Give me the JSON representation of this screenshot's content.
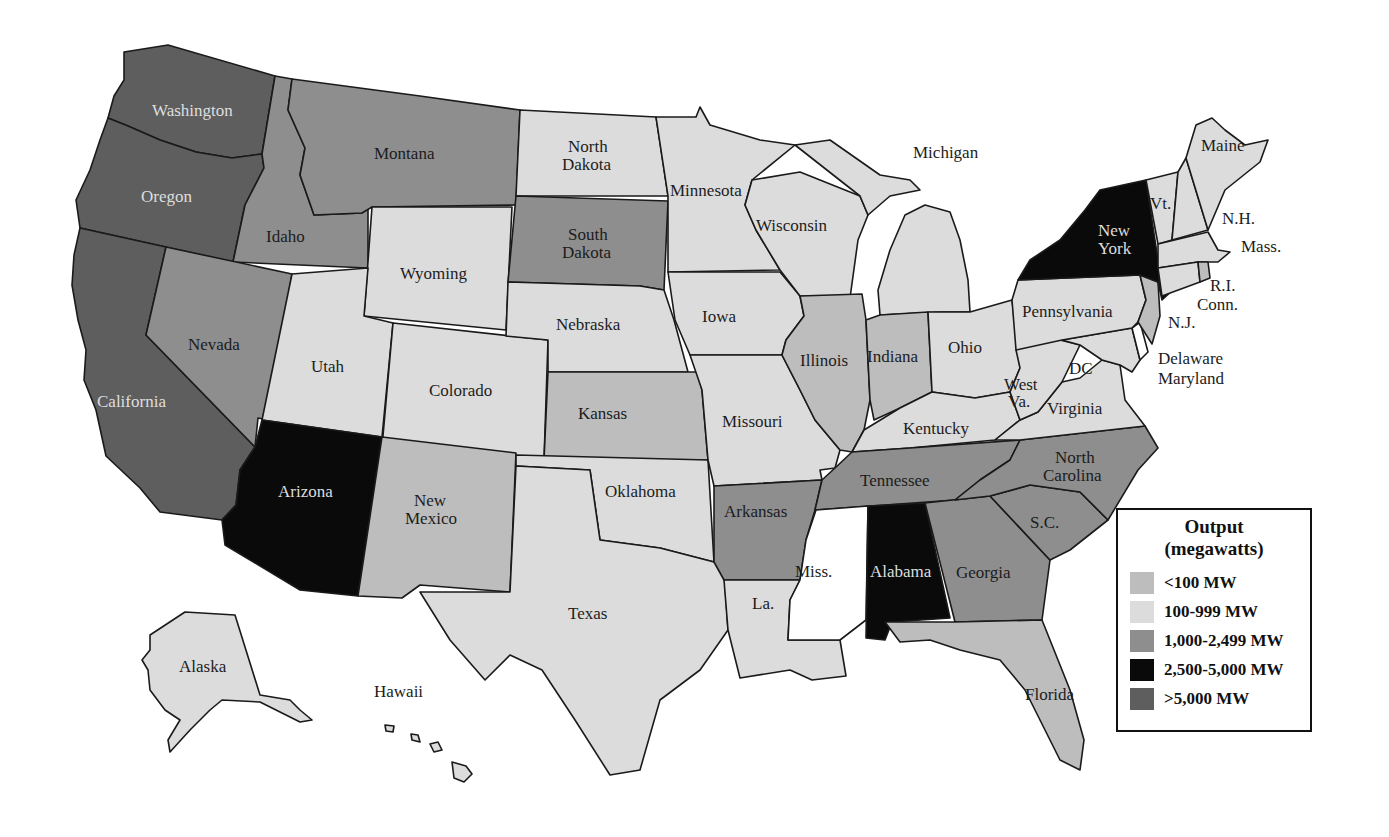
{
  "legend": {
    "title_line1": "Output",
    "title_line2": "(megawatts)",
    "items": [
      {
        "key": "lt100",
        "label": "<100 MW",
        "color": "#bdbdbd"
      },
      {
        "key": "c100_999",
        "label": "100-999 MW",
        "color": "#dcdcdc"
      },
      {
        "key": "c1000_2499",
        "label": "1,000-2,499 MW",
        "color": "#8e8e8e"
      },
      {
        "key": "c2500_5000",
        "label": "2,500-5,000 MW",
        "color": "#0a0a0a"
      },
      {
        "key": "gt5000",
        "label": ">5,000 MW",
        "color": "#5e5e5e"
      }
    ],
    "no_data_color": "#ffffff"
  },
  "states": {
    "washington": {
      "label": "Washington",
      "category": ">5,000 MW"
    },
    "oregon": {
      "label": "Oregon",
      "category": ">5,000 MW"
    },
    "california": {
      "label": "California",
      "category": ">5,000 MW"
    },
    "idaho": {
      "label": "Idaho",
      "category": "1,000-2,499 MW"
    },
    "montana": {
      "label": "Montana",
      "category": "1,000-2,499 MW"
    },
    "nevada": {
      "label": "Nevada",
      "category": "1,000-2,499 MW"
    },
    "wyoming": {
      "label": "Wyoming",
      "category": "100-999 MW"
    },
    "utah": {
      "label": "Utah",
      "category": "100-999 MW"
    },
    "colorado": {
      "label": "Colorado",
      "category": "100-999 MW"
    },
    "arizona": {
      "label": "Arizona",
      "category": "2,500-5,000 MW"
    },
    "new_mexico": {
      "label_line1": "New",
      "label_line2": "Mexico",
      "category": "<100 MW"
    },
    "north_dakota": {
      "label_line1": "North",
      "label_line2": "Dakota",
      "category": "100-999 MW"
    },
    "south_dakota": {
      "label_line1": "South",
      "label_line2": "Dakota",
      "category": "1,000-2,499 MW"
    },
    "nebraska": {
      "label": "Nebraska",
      "category": "100-999 MW"
    },
    "kansas": {
      "label": "Kansas",
      "category": "<100 MW"
    },
    "oklahoma": {
      "label": "Oklahoma",
      "category": "100-999 MW"
    },
    "texas": {
      "label": "Texas",
      "category": "100-999 MW"
    },
    "minnesota": {
      "label": "Minnesota",
      "category": "100-999 MW"
    },
    "iowa": {
      "label": "Iowa",
      "category": "100-999 MW"
    },
    "missouri": {
      "label": "Missouri",
      "category": "100-999 MW"
    },
    "arkansas": {
      "label": "Arkansas",
      "category": "1,000-2,499 MW"
    },
    "louisiana": {
      "label": "La.",
      "category": "100-999 MW"
    },
    "wisconsin": {
      "label": "Wisconsin",
      "category": "100-999 MW"
    },
    "illinois": {
      "label": "Illinois",
      "category": "<100 MW"
    },
    "michigan": {
      "label": "Michigan",
      "category": "100-999 MW"
    },
    "indiana": {
      "label": "Indiana",
      "category": "<100 MW"
    },
    "ohio": {
      "label": "Ohio",
      "category": "100-999 MW"
    },
    "kentucky": {
      "label": "Kentucky",
      "category": "100-999 MW"
    },
    "tennessee": {
      "label": "Tennessee",
      "category": "1,000-2,499 MW"
    },
    "mississippi": {
      "label": "Miss.",
      "category": "none"
    },
    "alabama": {
      "label": "Alabama",
      "category": "2,500-5,000 MW"
    },
    "georgia": {
      "label": "Georgia",
      "category": "1,000-2,499 MW"
    },
    "florida": {
      "label": "Florida",
      "category": "<100 MW"
    },
    "south_carolina": {
      "label": "S.C.",
      "category": "1,000-2,499 MW"
    },
    "north_carolina": {
      "label_line1": "North",
      "label_line2": "Carolina",
      "category": "1,000-2,499 MW"
    },
    "virginia": {
      "label": "Virginia",
      "category": "100-999 MW"
    },
    "west_virginia": {
      "label_line1": "West",
      "label_line2": "Va.",
      "category": "100-999 MW"
    },
    "dc": {
      "label": "DC",
      "category": "100-999 MW"
    },
    "maryland": {
      "label": "Maryland",
      "category": "100-999 MW"
    },
    "delaware": {
      "label": "Delaware",
      "category": "none"
    },
    "pennsylvania": {
      "label": "Pennsylvania",
      "category": "100-999 MW"
    },
    "new_jersey": {
      "label": "N.J.",
      "category": "<100 MW"
    },
    "new_york": {
      "label_line1": "New",
      "label_line2": "York",
      "category": "2,500-5,000 MW"
    },
    "connecticut": {
      "label": "Conn.",
      "category": "100-999 MW"
    },
    "rhode_island": {
      "label": "R.I.",
      "category": "<100 MW"
    },
    "massachusetts": {
      "label": "Mass.",
      "category": "100-999 MW"
    },
    "vermont": {
      "label": "Vt.",
      "category": "100-999 MW"
    },
    "new_hampshire": {
      "label": "N.H.",
      "category": "100-999 MW"
    },
    "maine": {
      "label": "Maine",
      "category": "100-999 MW"
    },
    "alaska": {
      "label": "Alaska",
      "category": "100-999 MW"
    },
    "hawaii": {
      "label": "Hawaii",
      "category": "100-999 MW"
    }
  }
}
